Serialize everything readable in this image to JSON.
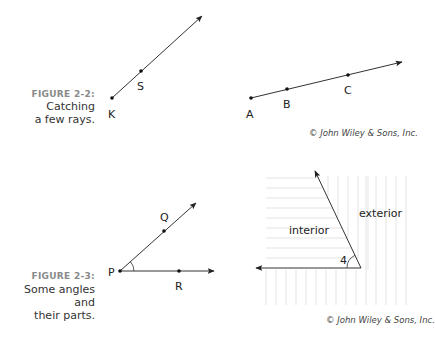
{
  "figure_2_2": {
    "label": "FIGURE 2-2:",
    "caption_line1": "Catching",
    "caption_line2": "a few rays.",
    "ray_ks": {
      "points": [
        {
          "name": "K",
          "x": 112,
          "y": 98
        },
        {
          "name": "S",
          "x": 141,
          "y": 71
        }
      ],
      "arrow_tip": {
        "x": 202,
        "y": 16
      }
    },
    "ray_abc": {
      "points": [
        {
          "name": "A",
          "x": 251,
          "y": 98
        },
        {
          "name": "B",
          "x": 287,
          "y": 89
        },
        {
          "name": "C",
          "x": 348,
          "y": 75
        }
      ],
      "arrow_tip": {
        "x": 402,
        "y": 62
      }
    },
    "labels": {
      "K": "K",
      "S": "S",
      "A": "A",
      "B": "B",
      "C": "C"
    },
    "credit": "© John Wiley & Sons, Inc."
  },
  "figure_2_3": {
    "label": "FIGURE 2-3:",
    "caption_line1": "Some angles and",
    "caption_line2": "their parts.",
    "angle_qpr": {
      "vertex": {
        "name": "P",
        "x": 120,
        "y": 271
      },
      "points": [
        {
          "name": "Q",
          "x": 164,
          "y": 231
        },
        {
          "name": "R",
          "x": 179,
          "y": 271
        }
      ]
    },
    "labels": {
      "P": "P",
      "Q": "Q",
      "R": "R",
      "angle_number": "4",
      "interior": "interior",
      "exterior": "exterior"
    },
    "credit": "© John Wiley & Sons, Inc."
  }
}
